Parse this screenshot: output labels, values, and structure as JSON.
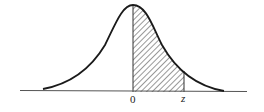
{
  "diagram": {
    "type": "standard-normal-curve",
    "shaded_region": {
      "from": "0",
      "to": "z"
    },
    "labels": {
      "origin": "0",
      "upper": "z"
    },
    "colors": {
      "curve": "#1a1a1a",
      "axis": "#444444",
      "hatch": "#333333",
      "background": "#ffffff"
    }
  }
}
